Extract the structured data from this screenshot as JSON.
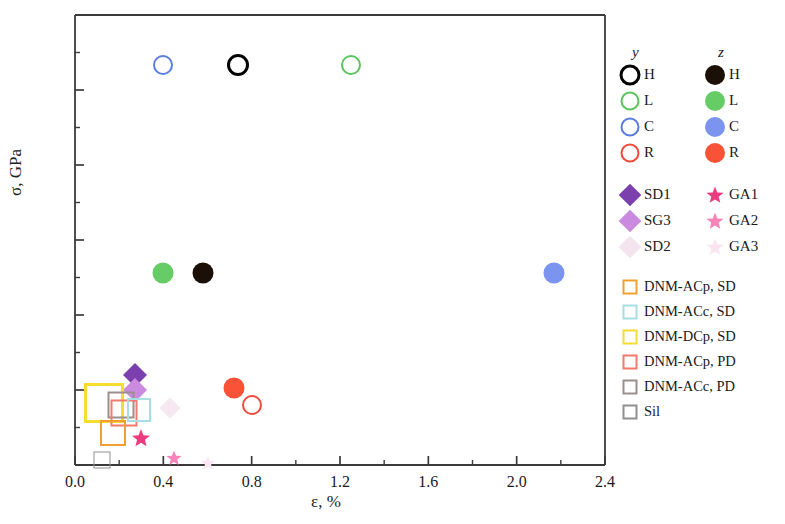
{
  "chart_data": {
    "type": "scatter",
    "title": "",
    "xlabel": "ε, %",
    "ylabel": "σ, GPa",
    "xlim": [
      0.0,
      2.4
    ],
    "ylim": [
      0,
      180
    ],
    "xticks": [
      "0.0",
      "0.4",
      "0.8",
      "1.2",
      "1.6",
      "2.0",
      "2.4"
    ],
    "xtick_values": [
      0.0,
      0.4,
      0.8,
      1.2,
      1.6,
      2.0,
      2.4
    ],
    "yticks": [
      "0",
      "30",
      "60",
      "90",
      "120",
      "150",
      "180"
    ],
    "ytick_values": [
      0,
      30,
      60,
      90,
      120,
      150,
      180
    ],
    "minor_ticks": true,
    "grid": false,
    "legend_position": "right",
    "legend_headers": [
      "y",
      "z"
    ],
    "series": [
      {
        "name": "H",
        "group": "y",
        "marker": "circle-open",
        "color": "#000000",
        "size": 22,
        "x": [
          0.74
        ],
        "y": [
          160
        ]
      },
      {
        "name": "L",
        "group": "y",
        "marker": "circle-open",
        "color": "#5cc45c",
        "size": 20,
        "x": [
          1.25
        ],
        "y": [
          160
        ]
      },
      {
        "name": "C",
        "group": "y",
        "marker": "circle-open",
        "color": "#5b7de0",
        "size": 20,
        "x": [
          0.4
        ],
        "y": [
          160
        ]
      },
      {
        "name": "R",
        "group": "y",
        "marker": "circle-open",
        "color": "#f0463c",
        "size": 20,
        "x": [
          0.8
        ],
        "y": [
          24
        ]
      },
      {
        "name": "H",
        "group": "z",
        "marker": "circle-fill",
        "color": "#1a1008",
        "size": 21,
        "x": [
          0.58
        ],
        "y": [
          77
        ]
      },
      {
        "name": "L",
        "group": "z",
        "marker": "circle-fill",
        "color": "#66cc66",
        "size": 21,
        "x": [
          0.4
        ],
        "y": [
          77
        ]
      },
      {
        "name": "C",
        "group": "z",
        "marker": "circle-fill",
        "color": "#7b94ef",
        "size": 21,
        "x": [
          2.17
        ],
        "y": [
          77
        ]
      },
      {
        "name": "R",
        "group": "z",
        "marker": "circle-fill",
        "color": "#fa5236",
        "size": 21,
        "x": [
          0.72
        ],
        "y": [
          31
        ]
      },
      {
        "name": "SD1",
        "group": "left",
        "marker": "diamond-fill",
        "color": "#7b3fae",
        "size": 17,
        "x": [
          0.27
        ],
        "y": [
          36
        ]
      },
      {
        "name": "SG3",
        "group": "left",
        "marker": "diamond-fill",
        "color": "#c98ae0",
        "size": 17,
        "x": [
          0.27
        ],
        "y": [
          30
        ]
      },
      {
        "name": "SD2",
        "group": "left",
        "marker": "diamond-fill",
        "color": "#f3e4ee",
        "size": 15,
        "x": [
          0.43
        ],
        "y": [
          23
        ]
      },
      {
        "name": "GA1",
        "group": "right",
        "marker": "star-fill",
        "color": "#ec3b7e",
        "size": 19,
        "x": [
          0.3
        ],
        "y": [
          11
        ]
      },
      {
        "name": "GA2",
        "group": "right",
        "marker": "star-fill",
        "color": "#f783b8",
        "size": 16,
        "x": [
          0.45
        ],
        "y": [
          3
        ]
      },
      {
        "name": "GA3",
        "group": "right",
        "marker": "star-fill",
        "color": "#fbe3ef",
        "size": 14,
        "x": [
          0.6
        ],
        "y": [
          1
        ]
      },
      {
        "name": "DNM-ACp, SD",
        "group": "wide",
        "marker": "square-open",
        "color": "#f0a030",
        "size": 23,
        "x": [
          0.17
        ],
        "y": [
          13
        ]
      },
      {
        "name": "DNM-ACc, SD",
        "group": "wide",
        "marker": "square-open",
        "color": "#a8dde4",
        "size": 23,
        "x": [
          0.27
        ],
        "y": [
          22
        ]
      },
      {
        "name": "DNM-DCp, SD",
        "group": "wide",
        "marker": "square-open",
        "color": "#f5dc30",
        "size": 38,
        "x": [
          0.13
        ],
        "y": [
          25
        ]
      },
      {
        "name": "DNM-ACp, PD",
        "group": "wide",
        "marker": "square-open",
        "color": "#f27b6b",
        "size": 25,
        "x": [
          0.21
        ],
        "y": [
          22
        ]
      },
      {
        "name": "DNM-ACc, PD",
        "group": "wide",
        "marker": "square-open",
        "color": "#9b8f8c",
        "size": 25,
        "x": [
          0.2
        ],
        "y": [
          24
        ]
      },
      {
        "name": "Sil",
        "group": "wide",
        "marker": "square-open",
        "color": "#8f8f8f",
        "size": 16,
        "x": [
          0.12
        ],
        "y": [
          2
        ]
      }
    ],
    "points": [
      {
        "label": "C-y",
        "x": 0.4,
        "y": 160,
        "marker": "circle-open",
        "color": "#5b7de0",
        "size": 20,
        "lw": 2.4
      },
      {
        "label": "H-y",
        "x": 0.74,
        "y": 160,
        "marker": "circle-open",
        "color": "#000000",
        "size": 22,
        "lw": 3.2
      },
      {
        "label": "L-y",
        "x": 1.25,
        "y": 160,
        "marker": "circle-open",
        "color": "#5cc45c",
        "size": 20,
        "lw": 2.4
      },
      {
        "label": "L-z",
        "x": 0.4,
        "y": 77,
        "marker": "circle-fill",
        "color": "#66cc66",
        "size": 21,
        "lw": 0
      },
      {
        "label": "H-z",
        "x": 0.58,
        "y": 77,
        "marker": "circle-fill",
        "color": "#1a1008",
        "size": 21,
        "lw": 0
      },
      {
        "label": "C-z",
        "x": 2.17,
        "y": 77,
        "marker": "circle-fill",
        "color": "#7b94ef",
        "size": 21,
        "lw": 0
      },
      {
        "label": "R-z",
        "x": 0.72,
        "y": 31,
        "marker": "circle-fill",
        "color": "#fa5236",
        "size": 21,
        "lw": 0
      },
      {
        "label": "R-y",
        "x": 0.8,
        "y": 24,
        "marker": "circle-open",
        "color": "#ef4b3c",
        "size": 20,
        "lw": 2.4
      },
      {
        "label": "SD1",
        "x": 0.27,
        "y": 36,
        "marker": "diamond-fill",
        "color": "#7b3fae",
        "size": 17,
        "lw": 0
      },
      {
        "label": "SG3",
        "x": 0.27,
        "y": 30,
        "marker": "diamond-fill",
        "color": "#c98ae0",
        "size": 17,
        "lw": 0
      },
      {
        "label": "SD2",
        "x": 0.43,
        "y": 23,
        "marker": "diamond-fill",
        "color": "#f5e8f0",
        "size": 15,
        "lw": 0
      },
      {
        "label": "GA1",
        "x": 0.3,
        "y": 11,
        "marker": "star-fill",
        "color": "#ec3b7e",
        "size": 19,
        "lw": 0
      },
      {
        "label": "GA2",
        "x": 0.45,
        "y": 3,
        "marker": "star-fill",
        "color": "#f783b8",
        "size": 16,
        "lw": 0
      },
      {
        "label": "GA3",
        "x": 0.6,
        "y": 1,
        "marker": "star-fill",
        "color": "#fbe6f1",
        "size": 15,
        "lw": 0
      },
      {
        "label": "DNM-DCp-SD",
        "x": 0.13,
        "y": 25,
        "marker": "square-open",
        "color": "#f5dc30",
        "size": 40,
        "lw": 3
      },
      {
        "label": "DNM-ACc-PD",
        "x": 0.21,
        "y": 24,
        "marker": "square-open",
        "color": "#9b8f8c",
        "size": 27,
        "lw": 2
      },
      {
        "label": "DNM-ACp-PD",
        "x": 0.22,
        "y": 21,
        "marker": "square-open",
        "color": "#f27b6b",
        "size": 27,
        "lw": 2
      },
      {
        "label": "DNM-ACc-SD",
        "x": 0.29,
        "y": 22,
        "marker": "square-open",
        "color": "#a8dde4",
        "size": 24,
        "lw": 2
      },
      {
        "label": "DNM-ACp-SD",
        "x": 0.17,
        "y": 13,
        "marker": "square-open",
        "color": "#f0a030",
        "size": 26,
        "lw": 2
      },
      {
        "label": "Sil",
        "x": 0.12,
        "y": 2,
        "marker": "square-open",
        "color": "#8f8f8f",
        "size": 17,
        "lw": 1.6
      }
    ]
  },
  "legend": {
    "header_y": "y",
    "header_z": "z",
    "rows_paired": [
      {
        "y_label": "H",
        "y_color": "#000000",
        "y_marker": "circle-open",
        "z_label": "H",
        "z_color": "#1a1008",
        "z_marker": "circle-fill"
      },
      {
        "y_label": "L",
        "y_color": "#5cc45c",
        "y_marker": "circle-open",
        "z_label": "L",
        "z_color": "#66cc66",
        "z_marker": "circle-fill"
      },
      {
        "y_label": "C",
        "y_color": "#5b7de0",
        "y_marker": "circle-open",
        "z_label": "C",
        "z_color": "#7b94ef",
        "z_marker": "circle-fill"
      },
      {
        "y_label": "R",
        "y_color": "#ef4b3c",
        "y_marker": "circle-open",
        "z_label": "R",
        "z_color": "#fa5236",
        "z_marker": "circle-fill"
      }
    ],
    "rows_pairs2": [
      {
        "left_label": "SD1",
        "left_color": "#7b3fae",
        "right_label": "GA1",
        "right_color": "#ec3b7e"
      },
      {
        "left_label": "SG3",
        "left_color": "#c98ae0",
        "right_label": "GA2",
        "right_color": "#f783b8"
      },
      {
        "left_label": "SD2",
        "left_color": "#f3e4ee",
        "right_label": "GA3",
        "right_color": "#fbe3ef"
      }
    ],
    "rows_squares": [
      {
        "label": "DNM-ACp, SD",
        "color": "#f0a030"
      },
      {
        "label": "DNM-ACc, SD",
        "color": "#a8dde4"
      },
      {
        "label": "DNM-DCp, SD",
        "color": "#f5dc30"
      },
      {
        "label": "DNM-ACp, PD",
        "color": "#f27b6b"
      },
      {
        "label": "DNM-ACc, PD",
        "color": "#9b8f8c"
      },
      {
        "label": "Sil",
        "color": "#8f8f8f"
      }
    ]
  },
  "axes": {
    "x_title": "ε, %",
    "y_title": "σ, GPa",
    "axis_color": "#3a3a3a"
  }
}
